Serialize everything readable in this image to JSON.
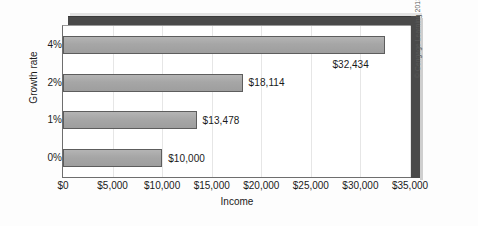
{
  "chart_data": {
    "type": "bar",
    "orientation": "horizontal",
    "title": "",
    "xlabel": "Income",
    "ylabel": "Growth rate",
    "categories": [
      "0%",
      "1%",
      "2%",
      "4%"
    ],
    "values": [
      10000,
      13478,
      18114,
      32434
    ],
    "data_labels": [
      "$10,000",
      "$13,478",
      "$18,114",
      "$32,434"
    ],
    "xlim": [
      0,
      35000
    ],
    "xticks": [
      0,
      5000,
      10000,
      15000,
      20000,
      25000,
      30000,
      35000
    ],
    "xtick_labels": [
      "$0",
      "$5,000",
      "$10,000",
      "$15,000",
      "$20,000",
      "$25,000",
      "$30,000",
      "$35,000"
    ],
    "grid": true,
    "grid_axis": "x",
    "legend": false,
    "bar_color": "#a9a9a9",
    "bar_edge_color": "#5d5d5d",
    "frame_color": "#4a4a4a",
    "series": [
      {
        "name": "Income",
        "values": [
          10000,
          13478,
          18114,
          32434
        ]
      }
    ]
  },
  "credit": {
    "text": "© Cengage Learning 2013"
  }
}
